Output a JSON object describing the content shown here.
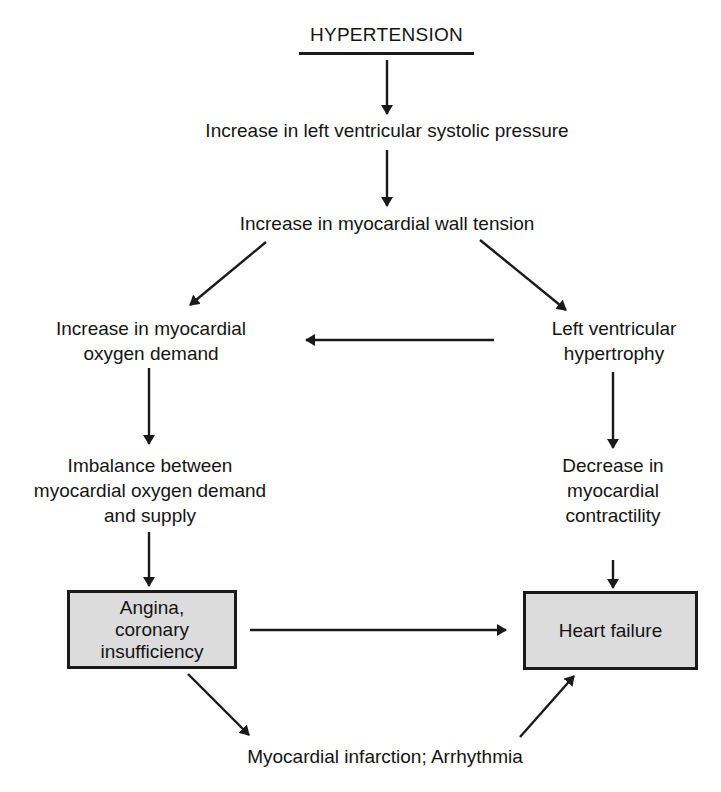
{
  "diagram": {
    "title": "HYPERTENSION",
    "nodes": {
      "lv_systolic_pressure": "Increase in left ventricular systolic pressure",
      "wall_tension": "Increase in myocardial wall tension",
      "oxygen_demand_line1": "Increase in myocardial",
      "oxygen_demand_line2": "oxygen demand",
      "lvh_line1": "Left ventricular",
      "lvh_line2": "hypertrophy",
      "imbalance_line1": "Imbalance between",
      "imbalance_line2": "myocardial oxygen demand",
      "imbalance_line3": "and supply",
      "contractility_line1": "Decrease in",
      "contractility_line2": "myocardial",
      "contractility_line3": "contractility",
      "angina_line1": "Angina,",
      "angina_line2": "coronary",
      "angina_line3": "insufficiency",
      "heart_failure": "Heart failure",
      "mi_arrhythmia": "Myocardial infarction; Arrhythmia"
    },
    "edges": [
      {
        "from": "HYPERTENSION",
        "to": "Increase in left ventricular systolic pressure"
      },
      {
        "from": "Increase in left ventricular systolic pressure",
        "to": "Increase in myocardial wall tension"
      },
      {
        "from": "Increase in myocardial wall tension",
        "to": "Increase in myocardial oxygen demand"
      },
      {
        "from": "Increase in myocardial wall tension",
        "to": "Left ventricular hypertrophy"
      },
      {
        "from": "Left ventricular hypertrophy",
        "to": "Increase in myocardial oxygen demand"
      },
      {
        "from": "Increase in myocardial oxygen demand",
        "to": "Imbalance between myocardial oxygen demand and supply"
      },
      {
        "from": "Left ventricular hypertrophy",
        "to": "Decrease in myocardial contractility"
      },
      {
        "from": "Imbalance between myocardial oxygen demand and supply",
        "to": "Angina, coronary insufficiency"
      },
      {
        "from": "Decrease in myocardial contractility",
        "to": "Heart failure"
      },
      {
        "from": "Angina, coronary insufficiency",
        "to": "Heart failure"
      },
      {
        "from": "Angina, coronary insufficiency",
        "to": "Myocardial infarction; Arrhythmia"
      },
      {
        "from": "Myocardial infarction; Arrhythmia",
        "to": "Heart failure"
      }
    ],
    "colors": {
      "box_fill": "#dcdcdc",
      "stroke": "#1a1a1a",
      "background": "#ffffff"
    }
  }
}
